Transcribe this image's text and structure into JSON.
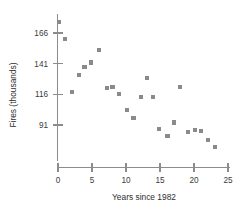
{
  "chart_data": {
    "type": "scatter",
    "title": "",
    "xlabel": "Years since 1982",
    "ylabel": "Fires (thousands)",
    "xlim": [
      -0.5,
      25.6
    ],
    "ylim": [
      70,
      178
    ],
    "grid": false,
    "legend_position": "none",
    "xticks": [
      0,
      5,
      10,
      15,
      20,
      25
    ],
    "xtick_labels": [
      "0",
      "5",
      "10",
      "15",
      "20",
      "25"
    ],
    "yticks": [
      91,
      116,
      141,
      166
    ],
    "ytick_labels": [
      "91",
      "116",
      "141",
      "166"
    ],
    "marker_color": "#8a8a8a",
    "marker_shape": "square",
    "axis_color": "#8c8c8c",
    "points": [
      {
        "x": 0.2,
        "y": 175
      },
      {
        "x": 1.0,
        "y": 161
      },
      {
        "x": 2.1,
        "y": 118
      },
      {
        "x": 3.1,
        "y": 132
      },
      {
        "x": 3.9,
        "y": 138
      },
      {
        "x": 4.8,
        "y": 142
      },
      {
        "x": 6.0,
        "y": 152
      },
      {
        "x": 7.2,
        "y": 121
      },
      {
        "x": 8.0,
        "y": 122
      },
      {
        "x": 9.0,
        "y": 116
      },
      {
        "x": 10.1,
        "y": 103
      },
      {
        "x": 11.1,
        "y": 97
      },
      {
        "x": 12.2,
        "y": 114
      },
      {
        "x": 13.1,
        "y": 129
      },
      {
        "x": 14.0,
        "y": 114
      },
      {
        "x": 14.9,
        "y": 88
      },
      {
        "x": 16.1,
        "y": 82
      },
      {
        "x": 17.1,
        "y": 93
      },
      {
        "x": 17.9,
        "y": 122
      },
      {
        "x": 19.1,
        "y": 85
      },
      {
        "x": 20.1,
        "y": 87
      },
      {
        "x": 21.0,
        "y": 86
      },
      {
        "x": 22.1,
        "y": 79
      },
      {
        "x": 23.1,
        "y": 73
      }
    ]
  }
}
